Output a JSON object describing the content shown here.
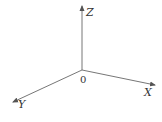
{
  "diagram": {
    "type": "3d-coordinate-axes",
    "origin": {
      "label": "0",
      "x": 82,
      "y": 70
    },
    "axes": [
      {
        "name": "Z",
        "label": "Z",
        "end": {
          "x": 82,
          "y": 6
        },
        "label_pos": {
          "x": 86,
          "y": 16
        }
      },
      {
        "name": "X",
        "label": "X",
        "end": {
          "x": 155,
          "y": 85
        },
        "label_pos": {
          "x": 144,
          "y": 96
        }
      },
      {
        "name": "Y",
        "label": "Y",
        "end": {
          "x": 13,
          "y": 102
        },
        "label_pos": {
          "x": 18,
          "y": 108
        }
      }
    ],
    "colors": {
      "axis": "#555555",
      "text": "#333333",
      "background": "#ffffff"
    }
  }
}
